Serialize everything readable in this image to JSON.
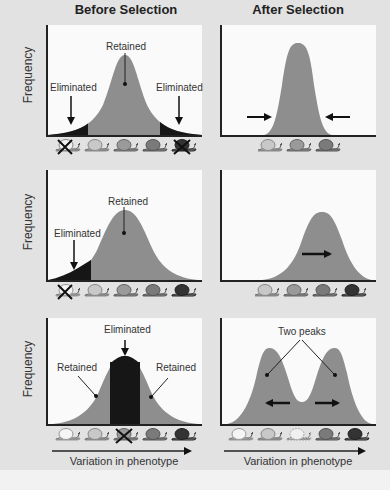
{
  "columns": {
    "before": "Before Selection",
    "after": "After Selection"
  },
  "axis": {
    "ylabel": "Frequency",
    "xlabel": "Variation in phenotype"
  },
  "rows": [
    {
      "type": "stabilizing",
      "before_labels": {
        "retained": "Retained",
        "eliminated_left": "Eliminated",
        "eliminated_right": "Eliminated"
      },
      "before_snails": [
        "eliminated-light",
        "light",
        "medium",
        "medium-dark",
        "eliminated-dark"
      ],
      "after_snails": [
        "light",
        "medium",
        "medium-dark"
      ],
      "after_arrows": [
        "inward-right",
        "inward-left"
      ]
    },
    {
      "type": "directional",
      "before_labels": {
        "retained": "Retained",
        "eliminated_left": "Eliminated"
      },
      "before_snails": [
        "eliminated-lightest",
        "light",
        "medium",
        "medium-dark",
        "dark"
      ],
      "after_snails": [
        "light",
        "medium",
        "medium-dark",
        "dark"
      ],
      "after_arrows": [
        "right"
      ]
    },
    {
      "type": "disruptive",
      "before_labels": {
        "eliminated_center": "Eliminated",
        "retained_left": "Retained",
        "retained_right": "Retained"
      },
      "after_labels": {
        "peaks": "Two peaks"
      },
      "before_snails": [
        "lightest",
        "light",
        "eliminated-medium",
        "medium-dark",
        "dark"
      ],
      "after_snails": [
        "lightest",
        "light",
        "faded-medium",
        "medium-dark",
        "dark"
      ],
      "after_arrows": [
        "left",
        "right"
      ]
    }
  ],
  "colors": {
    "curve_fill": "#8e8e8e",
    "eliminated_fill": "#161616",
    "panel_bg": "#fafafa",
    "page_bg": "#e2e2e2"
  }
}
